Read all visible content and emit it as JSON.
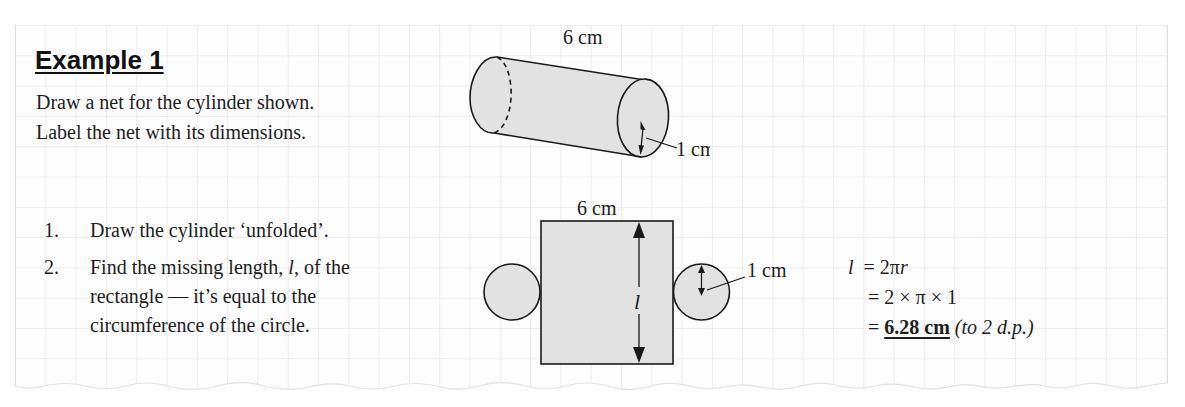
{
  "heading": "Example 1",
  "question": {
    "line1": "Draw a net for the cylinder shown.",
    "line2": "Label the net with its dimensions."
  },
  "steps": [
    {
      "number": "1.",
      "lines": [
        "Draw the cylinder ‘unfolded’."
      ]
    },
    {
      "number": "2.",
      "lines_parts": {
        "line1_before": "Find the missing length, ",
        "line1_var": "l",
        "line1_after": ", of the",
        "line2": "rectangle — it’s equal to the",
        "line3": "circumference of the circle."
      }
    }
  ],
  "cylinder_diagram": {
    "length_label": "6 cm",
    "radius_label": "1 cm"
  },
  "net_diagram": {
    "width_label": "6 cm",
    "length_var": "l",
    "radius_label": "1 cm"
  },
  "working": {
    "line1": {
      "lhs": "l",
      "rhs_prefix": "= 2π",
      "rhs_var": "r"
    },
    "line2": "= 2 × π × 1",
    "line3": {
      "prefix": "= ",
      "answer": "6.28 cm",
      "note": "(to 2 d.p.)"
    }
  },
  "colors": {
    "grid_line": "#dcdcdc",
    "shape_fill": "#e0e0e0",
    "stroke": "#1a1a1a",
    "text": "#1e1e1e"
  }
}
